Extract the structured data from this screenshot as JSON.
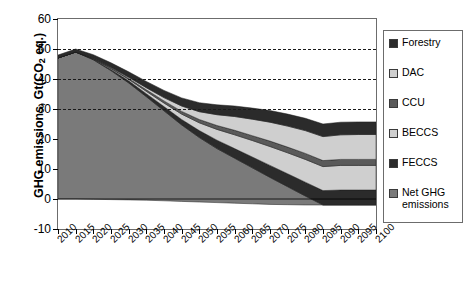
{
  "chart_data": {
    "type": "area",
    "title": "",
    "xlabel": "",
    "ylabel": "GHG emissions, Gt(CO",
    "ylabel_sub": "2",
    "ylabel_tail": " eq.)",
    "stacked": true,
    "grid": true,
    "gridlines": [
      50,
      40,
      30
    ],
    "legend_position": "right",
    "xlim": [
      2010,
      2100
    ],
    "ylim": [
      -10,
      60
    ],
    "yticks": [
      60,
      50,
      40,
      30,
      20,
      10,
      0,
      -10
    ],
    "x": [
      2010,
      2015,
      2020,
      2025,
      2030,
      2035,
      2040,
      2045,
      2050,
      2055,
      2060,
      2065,
      2070,
      2075,
      2080,
      2085,
      2090,
      2095,
      2100
    ],
    "xticklabels": [
      "2010",
      "2015",
      "2020",
      "2025",
      "2030",
      "2035",
      "2040",
      "2045",
      "2050",
      "2055",
      "2060",
      "2065",
      "2070",
      "2075",
      "2080",
      "2085",
      "2090",
      "2095",
      "2100"
    ],
    "series": [
      {
        "name": "Net GHG emissions",
        "color": "#7a7a7a",
        "values": [
          47.0,
          49.0,
          46.5,
          43.0,
          39.0,
          34.5,
          30.0,
          25.5,
          21.5,
          18.0,
          15.0,
          12.0,
          9.0,
          6.0,
          3.0,
          0.0,
          0.0,
          0.0,
          0.0
        ]
      },
      {
        "name": "FECCS",
        "color": "#2b2b2b",
        "values": [
          0.0,
          0.0,
          0.2,
          0.4,
          0.7,
          1.0,
          1.4,
          1.8,
          2.3,
          2.8,
          3.2,
          3.6,
          4.0,
          4.3,
          4.6,
          4.8,
          5.0,
          5.0,
          5.0
        ]
      },
      {
        "name": "BECCS",
        "color": "#cfcfcf",
        "values": [
          0.0,
          0.0,
          0.1,
          0.3,
          0.5,
          0.8,
          1.2,
          1.8,
          2.6,
          3.6,
          4.6,
          5.5,
          6.3,
          7.0,
          7.6,
          8.0,
          8.2,
          8.2,
          8.2
        ]
      },
      {
        "name": "CCU",
        "color": "#5a5a5a",
        "values": [
          0.0,
          0.0,
          0.1,
          0.2,
          0.3,
          0.5,
          0.7,
          0.9,
          1.1,
          1.3,
          1.5,
          1.6,
          1.8,
          1.9,
          2.0,
          2.0,
          2.0,
          2.0,
          2.0
        ]
      },
      {
        "name": "DAC",
        "color": "#cfcfcf",
        "values": [
          0.0,
          0.0,
          0.1,
          0.2,
          0.4,
          0.7,
          1.1,
          1.8,
          2.6,
          3.6,
          4.6,
          5.5,
          6.3,
          7.0,
          7.6,
          8.0,
          8.2,
          8.3,
          8.3
        ]
      },
      {
        "name": "Forestry",
        "color": "#2b2b2b",
        "values": [
          1.0,
          1.0,
          1.2,
          1.5,
          1.8,
          2.1,
          2.4,
          2.7,
          3.0,
          3.3,
          3.5,
          3.7,
          3.9,
          4.0,
          4.1,
          4.2,
          4.2,
          4.2,
          4.2
        ]
      }
    ],
    "baseline_offset": [
      0.0,
      0.0,
      -0.1,
      -0.2,
      -0.3,
      -0.4,
      -0.6,
      -0.8,
      -1.0,
      -1.2,
      -1.4,
      -1.6,
      -1.8,
      -1.9,
      -2.0,
      -2.0,
      -2.0,
      -2.0,
      -2.0
    ]
  },
  "legend": {
    "items": [
      {
        "label": "Forestry",
        "label2": "",
        "color": "#2b2b2b"
      },
      {
        "label": "DAC",
        "label2": "",
        "color": "#cfcfcf"
      },
      {
        "label": "CCU",
        "label2": "",
        "color": "#5a5a5a"
      },
      {
        "label": "BECCS",
        "label2": "",
        "color": "#cfcfcf"
      },
      {
        "label": "FECCS",
        "label2": "",
        "color": "#2b2b2b"
      },
      {
        "label": "Net GHG",
        "label2": "emissions",
        "color": "#7a7a7a"
      }
    ]
  }
}
